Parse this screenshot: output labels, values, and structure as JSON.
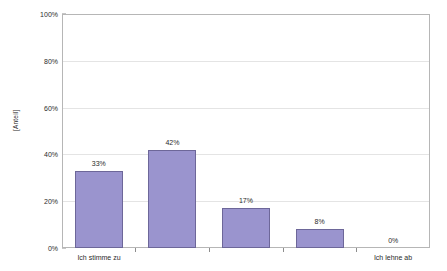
{
  "chart_data": {
    "type": "bar",
    "title": "",
    "xlabel": "",
    "ylabel": "[Anteil]",
    "categories": [
      "Ich stimme zu",
      "",
      "",
      "",
      "Ich lehne ab"
    ],
    "values": [
      33,
      42,
      17,
      8,
      0
    ],
    "value_labels": [
      "33%",
      "42%",
      "17%",
      "8%",
      "0%"
    ],
    "ylim": [
      0,
      100
    ],
    "yticks": [
      0,
      20,
      40,
      60,
      80,
      100
    ],
    "ytick_labels": [
      "0%",
      "20%",
      "40%",
      "60%",
      "80%",
      "100%"
    ],
    "grid": true,
    "legend": "none",
    "series_color": "#9a94ce",
    "series_border_color": "#6d6799",
    "grid_color": "#e4e4e4",
    "frame_color": "#b6b6b6",
    "axis_text_color": "#2b2b2b",
    "xtick_labels_shown": [
      "Ich stimme zu",
      "Ich lehne ab"
    ]
  }
}
